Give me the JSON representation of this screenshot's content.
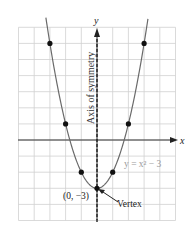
{
  "figure": {
    "axis_x_label": "x",
    "axis_y_label": "y",
    "symmetry_label": "Axis of symmetry",
    "equation_label": "y = x² − 3",
    "vertex_coords_label": "(0, −3)",
    "vertex_label": "Vertex",
    "colors": {
      "grid": "#d0d0d0",
      "axis": "#333333",
      "curve": "#6a6a6a",
      "points": "#111111",
      "equation": "#9a9a9a"
    }
  },
  "chart_data": {
    "type": "line",
    "title": "",
    "function": "y = x^2 - 3",
    "xlabel": "x",
    "ylabel": "y",
    "xlim": [
      -5,
      5
    ],
    "ylim": [
      -5,
      7
    ],
    "grid": true,
    "points": [
      {
        "x": -3,
        "y": 6
      },
      {
        "x": -2,
        "y": 1
      },
      {
        "x": -1,
        "y": -2
      },
      {
        "x": 0,
        "y": -3
      },
      {
        "x": 1,
        "y": -2
      },
      {
        "x": 2,
        "y": 1
      },
      {
        "x": 3,
        "y": 6
      }
    ],
    "annotations": [
      "Axis of symmetry (x = 0)",
      "Vertex (0, -3)",
      "y = x^2 - 3"
    ]
  }
}
